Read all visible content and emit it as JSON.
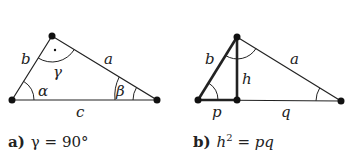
{
  "diagrams": [
    {
      "id": "a",
      "labels": {
        "side_b": "b",
        "side_a": "a",
        "side_c": "c",
        "angle_alpha": "α",
        "angle_beta": "β",
        "angle_gamma": "γ"
      },
      "caption": {
        "letter": "a)",
        "formula": "γ = 90°"
      }
    },
    {
      "id": "b",
      "labels": {
        "side_b": "b",
        "side_a": "a",
        "height": "h",
        "segment_p": "p",
        "segment_q": "q"
      },
      "caption": {
        "letter": "b)",
        "formula_h": "h",
        "formula_exp": "2",
        "formula_rest": " = pq"
      }
    }
  ],
  "colors": {
    "stroke": "#222222",
    "background": "#ffffff"
  }
}
